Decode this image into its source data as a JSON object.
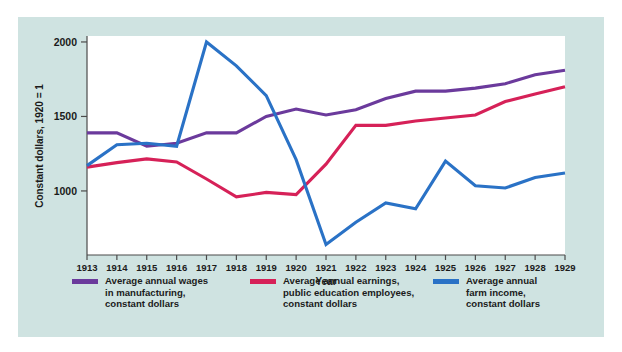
{
  "figure": {
    "background_color": "#cfe3e1",
    "panel_color": "#ffffff"
  },
  "chart_data": {
    "type": "line",
    "title": "",
    "xlabel": "Year",
    "ylabel": "Constant dollars, 1920 = 1",
    "categories": [
      1913,
      1914,
      1915,
      1916,
      1917,
      1918,
      1919,
      1920,
      1921,
      1922,
      1923,
      1924,
      1925,
      1926,
      1927,
      1928,
      1929
    ],
    "x_tick_labels": [
      "1913",
      "1914",
      "1915",
      "1916",
      "1917",
      "1918",
      "1919",
      "1920",
      "1921",
      "1922",
      "1923",
      "1924",
      "1925",
      "1926",
      "1927",
      "1928",
      "1929"
    ],
    "y_tick_labels": [
      "1000",
      "1500",
      "2000"
    ],
    "y_ticks": [
      1000,
      1500,
      2000
    ],
    "ylim": [
      570,
      2040
    ],
    "xlim": [
      1913,
      1929
    ],
    "grid": false,
    "legend_position": "below",
    "series": [
      {
        "name": "Average annual wages\nin manufacturing,\nconstant dollars",
        "color": "#6b3a9c",
        "values": [
          1390,
          1390,
          1300,
          1320,
          1390,
          1390,
          1500,
          1550,
          1510,
          1545,
          1620,
          1670,
          1670,
          1690,
          1720,
          1780,
          1810
        ]
      },
      {
        "name": "Average annual earnings,\npublic education employees,\nconstant dollars",
        "color": "#d62158",
        "values": [
          1160,
          1190,
          1215,
          1195,
          1080,
          960,
          990,
          975,
          1180,
          1440,
          1440,
          1470,
          1490,
          1510,
          1600,
          1650,
          1700
        ]
      },
      {
        "name": "Average annual\nfarm income,\nconstant dollars",
        "color": "#2a72c6",
        "values": [
          1170,
          1310,
          1320,
          1300,
          2000,
          1840,
          1640,
          1210,
          640,
          790,
          920,
          880,
          1200,
          1035,
          1020,
          1090,
          1120
        ]
      }
    ]
  }
}
